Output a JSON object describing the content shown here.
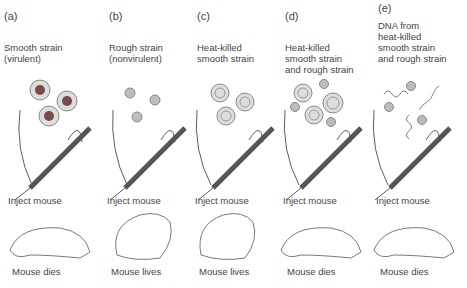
{
  "panels": [
    {
      "letter": "(a)",
      "title": "Smooth strain\n(virulent)",
      "inject": "Inject mouse",
      "outcome": "Mouse dies"
    },
    {
      "letter": "(b)",
      "title": "Rough strain\n(nonvirulent)",
      "inject": "Inject mouse",
      "outcome": "Mouse lives"
    },
    {
      "letter": "(c)",
      "title": "Heat-killed\nsmooth strain",
      "inject": "Inject mouse",
      "outcome": "Mouse lives"
    },
    {
      "letter": "(d)",
      "title": "Heat-killed\nsmooth strain\nand rough strain",
      "inject": "Inject mouse",
      "outcome": "Mouse dies"
    },
    {
      "letter": "(e)",
      "title": "DNA from\nheat-killed\nsmooth strain\nand rough strain",
      "inject": "Inject mouse",
      "outcome": "Mouse dies"
    }
  ],
  "colors": {
    "cell_outer": "#d9d9d9",
    "cell_core_live": "#7a4a48",
    "rough_cell": "#bdbdbd",
    "line": "#333333"
  }
}
